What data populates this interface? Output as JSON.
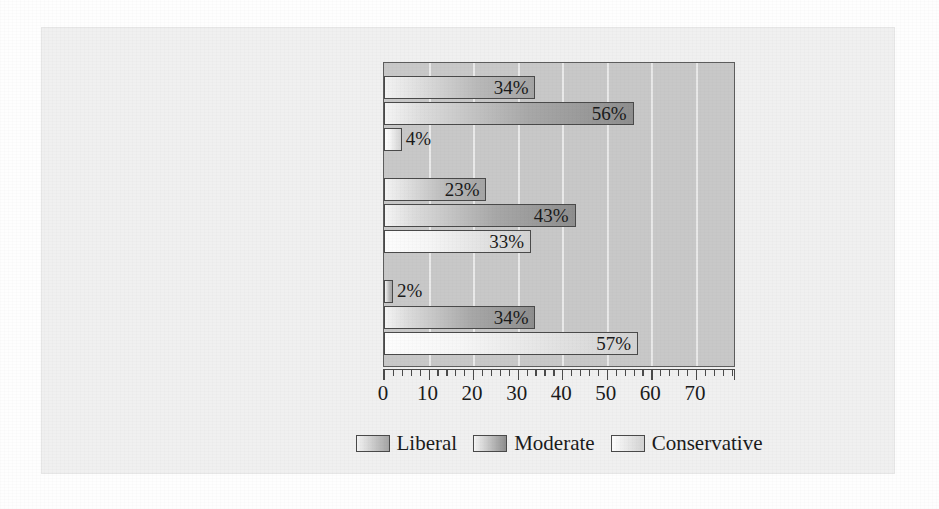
{
  "chart_data": {
    "type": "bar",
    "orientation": "horizontal",
    "title": "",
    "xlabel": "",
    "ylabel": "",
    "xlim": [
      0,
      79
    ],
    "xticks": [
      0,
      10,
      20,
      30,
      40,
      50,
      60,
      70
    ],
    "xtick_labels": [
      "0",
      "10",
      "20",
      "30",
      "40",
      "50",
      "60",
      "70"
    ],
    "minor_tick_step": 2,
    "grid": true,
    "grid_axis": "x",
    "value_suffix": "%",
    "legend_position": "bottom-center",
    "categories": [
      "Democratic Party Activists",
      "All Voters",
      "Republican Party Activists"
    ],
    "series": [
      {
        "name": "Liberal",
        "values": [
          34,
          23,
          2
        ],
        "labels": [
          "34%",
          "23%",
          "2%"
        ]
      },
      {
        "name": "Moderate",
        "values": [
          56,
          43,
          34
        ],
        "labels": [
          "56%",
          "43%",
          "34%"
        ]
      },
      {
        "name": "Conservative",
        "values": [
          4,
          33,
          57
        ],
        "labels": [
          "4%",
          "33%",
          "57%"
        ]
      }
    ],
    "colors": {
      "liberal": "#b9b9b9",
      "moderate": "#a8a8a8",
      "conservative": "#e0e0e0",
      "plot_background": "#c8c8c8",
      "page_background": "#f0f0f0",
      "axis": "#4a4a4a",
      "gridline": "#eeeeee",
      "text": "#1b1b1b"
    }
  },
  "legend": {
    "items": [
      {
        "label": "Liberal",
        "key": "liberal"
      },
      {
        "label": "Moderate",
        "key": "moderate"
      },
      {
        "label": "Conservative",
        "key": "conservative"
      }
    ]
  }
}
